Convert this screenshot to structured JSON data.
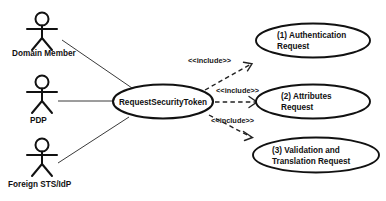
{
  "diagram": {
    "type": "uml-use-case-diagram",
    "background_color": "#ffffff",
    "line_color": "#111111",
    "text_color": "#111111"
  },
  "actors": [
    {
      "id": "domain-member",
      "label": "Domain Member"
    },
    {
      "id": "pdp",
      "label": "PDP"
    },
    {
      "id": "foreign-sts-idp",
      "label": "Foreign STS/IdP"
    }
  ],
  "use_cases": {
    "primary": {
      "id": "request-security-token",
      "label": "RequestSecurityToken"
    },
    "included": [
      {
        "id": "authentication-request",
        "line1": "(1) Authentication",
        "line2": "Request"
      },
      {
        "id": "attributes-request",
        "line1": "(2) Attributes",
        "line2": "Request"
      },
      {
        "id": "validation-translation-request",
        "line1": "(3) Validation and",
        "line2": "Translation Request"
      }
    ]
  },
  "relationships": {
    "stereotype": "<<include>>",
    "include_labels": [
      "<<include>>",
      "<<include>>",
      "<<include>>"
    ],
    "associations": [
      {
        "from": "domain-member",
        "to": "request-security-token"
      },
      {
        "from": "pdp",
        "to": "request-security-token"
      },
      {
        "from": "foreign-sts-idp",
        "to": "request-security-token"
      }
    ]
  }
}
